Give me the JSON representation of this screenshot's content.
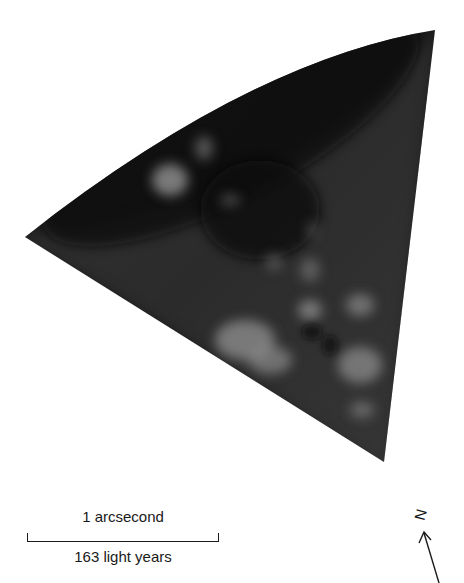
{
  "figure": {
    "colors": {
      "background": "#ffffff",
      "cone_dark": "#1c1c1c",
      "cone_mid": "#3a3a3a",
      "clump": "#8a8a8a"
    }
  },
  "scale_bar": {
    "angular_label": "1 arcsecond",
    "distance_label": "163 light years"
  },
  "compass": {
    "label": "N",
    "icon": "north-arrow-icon"
  }
}
